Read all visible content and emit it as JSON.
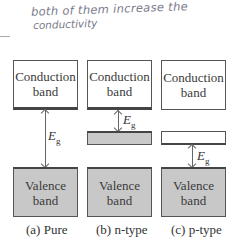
{
  "annotation": {
    "line1": "both of them increase the",
    "line2": "conductivity"
  },
  "panels": [
    {
      "caption": "(a) Pure",
      "conduction_label": [
        "Conduction",
        "band"
      ],
      "valence_label": [
        "Valence",
        "band"
      ],
      "gap_label": "E",
      "gap_sub": "g",
      "impurity_level": "none"
    },
    {
      "caption": "(b) n-type",
      "conduction_label": [
        "Conduction",
        "band"
      ],
      "valence_label": [
        "Valence",
        "band"
      ],
      "gap_label": "E",
      "gap_sub": "g",
      "impurity_level": "donor (filled, near conduction band)"
    },
    {
      "caption": "(c) p-type",
      "conduction_label": [
        "Conduction",
        "band"
      ],
      "valence_label": [
        "Valence",
        "band"
      ],
      "gap_label": "E",
      "gap_sub": "g",
      "impurity_level": "acceptor (empty, near valence band)"
    }
  ],
  "colors": {
    "filled_band": "#c8c8c8",
    "empty_band": "#ffffff",
    "outline": "#444444",
    "handwriting": "#7a7a8a"
  }
}
